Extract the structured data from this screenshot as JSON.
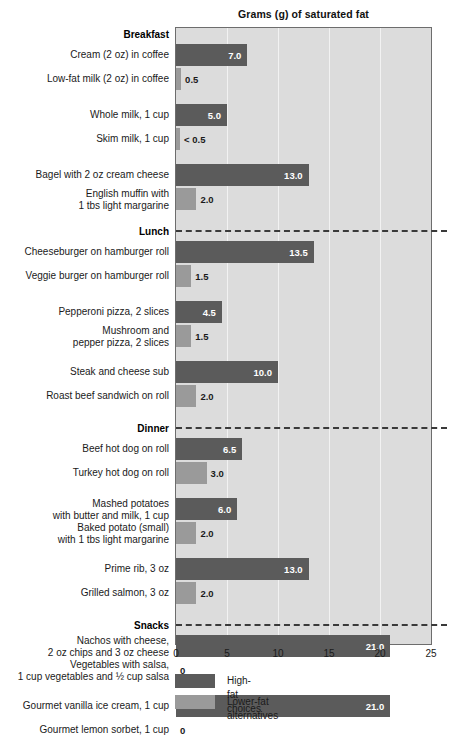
{
  "chart_data": {
    "type": "bar",
    "title": "Grams (g) of saturated fat",
    "xlabel": "",
    "ylabel": "",
    "xlim": [
      0,
      25
    ],
    "xticks": [
      "0",
      "5",
      "10",
      "15",
      "20",
      "25"
    ],
    "orientation": "horizontal",
    "grid": "vertical",
    "legend_position": "bottom-left",
    "colors": {
      "high_fat": "#5b5b5b",
      "lower_fat": "#9a9a9a",
      "plot_background": "#dcdcdc"
    },
    "legend": [
      {
        "key": "high",
        "label": "High-fat choices"
      },
      {
        "key": "low",
        "label": "Lower-fat alternatives"
      }
    ],
    "groups": [
      {
        "name": "Breakfast",
        "pairs": [
          {
            "high": {
              "label": "Cream (2 oz) in coffee",
              "value": 7.0,
              "value_label": "7.0"
            },
            "low": {
              "label": "Low-fat milk (2 oz) in coffee",
              "value": 0.5,
              "value_label": "0.5"
            }
          },
          {
            "high": {
              "label": "Whole milk, 1 cup",
              "value": 5.0,
              "value_label": "5.0"
            },
            "low": {
              "label": "Skim milk, 1 cup",
              "value": 0.4,
              "value_label": "< 0.5"
            }
          },
          {
            "high": {
              "label": "Bagel with 2 oz cream cheese",
              "value": 13.0,
              "value_label": "13.0"
            },
            "low": {
              "label": "English muffin with\n1 tbs light margarine",
              "value": 2.0,
              "value_label": "2.0"
            }
          }
        ]
      },
      {
        "name": "Lunch",
        "pairs": [
          {
            "high": {
              "label": "Cheeseburger on hamburger roll",
              "value": 13.5,
              "value_label": "13.5"
            },
            "low": {
              "label": "Veggie burger on hamburger roll",
              "value": 1.5,
              "value_label": "1.5"
            }
          },
          {
            "high": {
              "label": "Pepperoni pizza, 2 slices",
              "value": 4.5,
              "value_label": "4.5"
            },
            "low": {
              "label": "Mushroom and\npepper pizza, 2 slices",
              "value": 1.5,
              "value_label": "1.5"
            }
          },
          {
            "high": {
              "label": "Steak and cheese sub",
              "value": 10.0,
              "value_label": "10.0"
            },
            "low": {
              "label": "Roast beef sandwich on roll",
              "value": 2.0,
              "value_label": "2.0"
            }
          }
        ]
      },
      {
        "name": "Dinner",
        "pairs": [
          {
            "high": {
              "label": "Beef hot dog on roll",
              "value": 6.5,
              "value_label": "6.5"
            },
            "low": {
              "label": "Turkey hot dog on roll",
              "value": 3.0,
              "value_label": "3.0"
            }
          },
          {
            "high": {
              "label": "Mashed potatoes\nwith butter and milk, 1 cup",
              "value": 6.0,
              "value_label": "6.0"
            },
            "low": {
              "label": "Baked potato (small)\nwith 1 tbs light margarine",
              "value": 2.0,
              "value_label": "2.0"
            }
          },
          {
            "high": {
              "label": "Prime rib, 3 oz",
              "value": 13.0,
              "value_label": "13.0"
            },
            "low": {
              "label": "Grilled salmon, 3 oz",
              "value": 2.0,
              "value_label": "2.0"
            }
          }
        ]
      },
      {
        "name": "Snacks",
        "pairs": [
          {
            "high": {
              "label": "Nachos with cheese,\n2 oz chips and 3 oz cheese",
              "value": 21.0,
              "value_label": "21.0"
            },
            "low": {
              "label": "Vegetables with salsa,\n1 cup vegetables and ½ cup salsa",
              "value": 0,
              "value_label": "0"
            }
          },
          {
            "high": {
              "label": "Gourmet vanilla ice cream, 1 cup",
              "value": 21.0,
              "value_label": "21.0"
            },
            "low": {
              "label": "Gourmet lemon sorbet, 1 cup",
              "value": 0,
              "value_label": "0"
            }
          }
        ]
      }
    ]
  }
}
